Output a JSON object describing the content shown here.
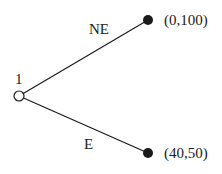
{
  "diagram": {
    "type": "game-tree",
    "root": {
      "id": "root",
      "player_label": "1",
      "x": 19,
      "y": 96,
      "style": "open"
    },
    "branches": [
      {
        "action": "NE",
        "to": {
          "x": 148,
          "y": 20,
          "payoff": "(0,100)",
          "style": "filled"
        }
      },
      {
        "action": "E",
        "to": {
          "x": 148,
          "y": 153,
          "payoff": "(40,50)",
          "style": "filled"
        }
      }
    ],
    "colors": {
      "line": "#1a1a1a",
      "node_fill": "#1a1a1a",
      "open_fill": "#ffffff"
    }
  }
}
